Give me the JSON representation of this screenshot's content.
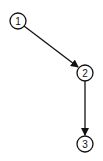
{
  "diagram": {
    "type": "directed-graph",
    "nodes": [
      {
        "id": "1",
        "label": "1",
        "cx": 18,
        "cy": 21,
        "r": 8
      },
      {
        "id": "2",
        "label": "2",
        "cx": 85,
        "cy": 73,
        "r": 8
      },
      {
        "id": "3",
        "label": "3",
        "cx": 85,
        "cy": 144,
        "r": 8
      }
    ],
    "edges": [
      {
        "from": "1",
        "to": "2",
        "x1": 24,
        "y1": 26,
        "x2": 78,
        "y2": 67
      },
      {
        "from": "2",
        "to": "3",
        "x1": 85,
        "y1": 81,
        "x2": 85,
        "y2": 135
      }
    ],
    "colors": {
      "stroke": "#111111",
      "background": "#ffffff"
    }
  }
}
